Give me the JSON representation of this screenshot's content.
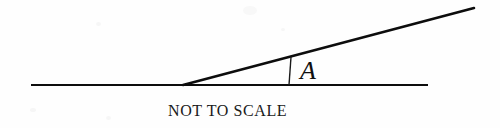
{
  "figure": {
    "background_color": "#fefefe",
    "stroke_color": "#0d0d0d",
    "caption": "NOT TO SCALE",
    "angle_label": "A",
    "geometry": {
      "width": 500,
      "height": 128,
      "vertex": [
        183,
        85
      ],
      "horizontal_ray": {
        "from": [
          31,
          85
        ],
        "to": [
          428,
          85
        ],
        "stroke_width": 2.2
      },
      "diagonal_ray": {
        "from": [
          183,
          85
        ],
        "to": [
          474,
          8
        ],
        "stroke_width": 2.6,
        "angle_degrees": 14.8
      },
      "angle_tick": {
        "from": [
          291,
          57
        ],
        "to": [
          289,
          85
        ],
        "stroke_width": 1.4
      },
      "angle_label_position": [
        300,
        58
      ],
      "caption_position": [
        168,
        103
      ],
      "caption_width": 113
    }
  }
}
